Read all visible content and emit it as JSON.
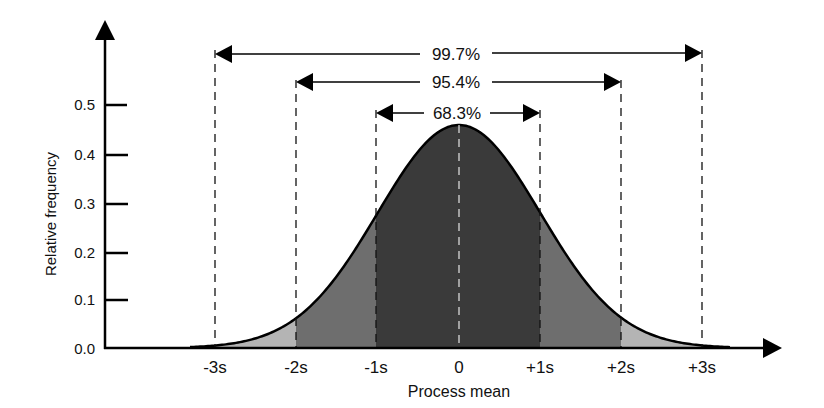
{
  "chart_data": {
    "type": "area",
    "title": "",
    "xlabel": "Process mean",
    "ylabel": "Relative frequency",
    "ylim": [
      0.0,
      0.5
    ],
    "yticks": [
      "0.0",
      "0.1",
      "0.2",
      "0.3",
      "0.4",
      "0.5"
    ],
    "categories": [
      "-3s",
      "-2s",
      "-1s",
      "0",
      "+1s",
      "+2s",
      "+3s"
    ],
    "x": [
      -3,
      -2,
      -1,
      0,
      1,
      2,
      3
    ],
    "values": [
      0.004,
      0.091,
      0.29,
      0.46,
      0.29,
      0.091,
      0.004
    ],
    "grid": false,
    "legend": "none",
    "regions": [
      {
        "label": "68.3%",
        "from": "-1s",
        "to": "+1s",
        "shade": "#3a3a3a"
      },
      {
        "label": "95.4%",
        "from": "-2s",
        "to": "+2s",
        "shade": "#6e6e6e"
      },
      {
        "label": "99.7%",
        "from": "-3s",
        "to": "+3s",
        "shade": "#b4b4b4"
      }
    ]
  },
  "labels": {
    "xlabel": "Process mean",
    "ylabel": "Relative frequency",
    "span_997": "99.7%",
    "span_954": "95.4%",
    "span_683": "68.3%",
    "yt0": "0.0",
    "yt1": "0.1",
    "yt2": "0.2",
    "yt3": "0.3",
    "yt4": "0.4",
    "yt5": "0.5",
    "xm3": "-3s",
    "xm2": "-2s",
    "xm1": "-1s",
    "x0": "0",
    "xp1": "+1s",
    "xp2": "+2s",
    "xp3": "+3s"
  },
  "colors": {
    "inner": "#3a3a3a",
    "middle": "#6e6e6e",
    "outer": "#b4b4b4",
    "line": "#000000"
  }
}
